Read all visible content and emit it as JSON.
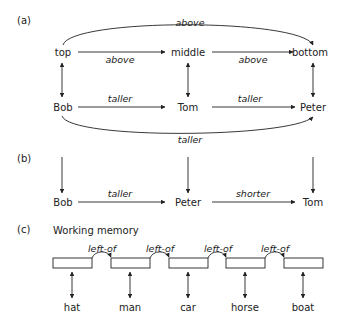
{
  "panel_a": {
    "label": "(a)",
    "top_row": [
      "top",
      "middle",
      "bottom"
    ],
    "bottom_row": [
      "Bob",
      "Tom",
      "Peter"
    ],
    "relation_top_arc": "above",
    "relation_top_1": "above",
    "relation_top_2": "above",
    "relation_bottom_1": "taller",
    "relation_bottom_2": "taller",
    "relation_bottom_arc": "taller"
  },
  "panel_b": {
    "label": "(b)",
    "row": [
      "Bob",
      "Peter",
      "Tom"
    ],
    "relation_1": "taller",
    "relation_2": "shorter"
  },
  "panel_c": {
    "label": "(c)",
    "title": "Working memory",
    "relation": "left-of",
    "items": [
      "hat",
      "man",
      "car",
      "horse",
      "boat"
    ]
  }
}
